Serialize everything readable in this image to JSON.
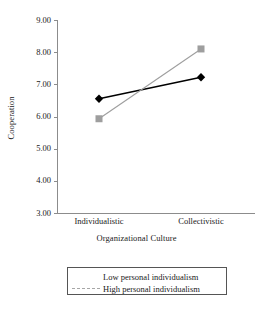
{
  "chart_data": {
    "type": "line",
    "title": "",
    "subtitle": "",
    "xlabel": "Organizational Culture",
    "ylabel": "Cooperation",
    "categories": [
      "Individualistic",
      "Collectivistic"
    ],
    "ylim": [
      3.0,
      9.0
    ],
    "ytick_step": 1.0,
    "ytick_labels": [
      "9.00",
      "8.00",
      "7.00",
      "6.00",
      "5.00",
      "4.00",
      "3.00"
    ],
    "ytick_values": [
      9.0,
      8.0,
      7.0,
      6.0,
      5.0,
      4.0,
      3.0
    ],
    "grid": false,
    "legend_position": "bottom",
    "series": [
      {
        "name": "Low personal individualism",
        "values": [
          6.55,
          7.22
        ],
        "color": "#000000",
        "marker": "diamond",
        "line_style": "solid"
      },
      {
        "name": "High personal individualism",
        "values": [
          5.93,
          8.1
        ],
        "color": "#9e9e9e",
        "marker": "square",
        "line_style": "solid"
      }
    ],
    "annotations": []
  },
  "axis": {
    "y_title": "Cooperation",
    "x_title": "Organizational Culture",
    "axis_color": "#8c8c8c"
  },
  "legend": {
    "entries": [
      {
        "label": "Low personal individualism",
        "marker": "diamond-marker",
        "color": "#000000"
      },
      {
        "label": "High personal individualism",
        "marker": "square-marker",
        "color": "#9e9e9e"
      }
    ]
  }
}
